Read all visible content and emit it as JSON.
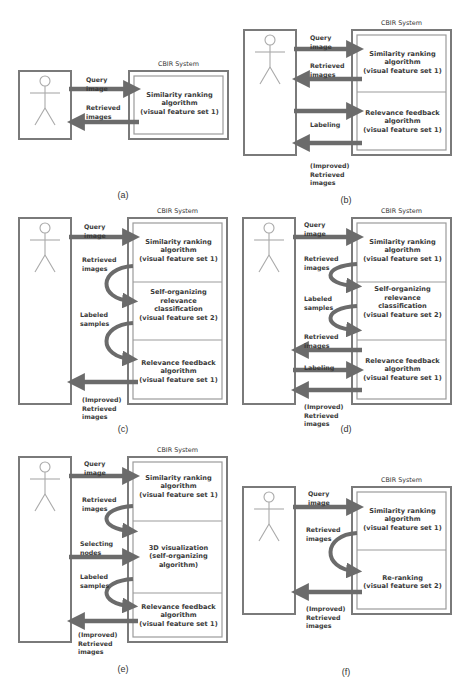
{
  "colors": {
    "outer_border": "#7a7a7a",
    "inner_border": "#9b9b9b",
    "arrow": "#6b6b6b",
    "stick_figure": "#a9a9a9",
    "text": "#3a3a3a"
  },
  "panels": [
    {
      "caption": "(a)",
      "system_title": "CBIR System",
      "modules": [
        [
          "Similarity ranking",
          "algorithm",
          "(visual feature set 1)"
        ]
      ],
      "labels": [
        [
          "Query",
          "image"
        ],
        [
          "Retrieved",
          "images"
        ]
      ]
    },
    {
      "caption": "(b)",
      "system_title": "CBIR System",
      "modules": [
        [
          "Similarity ranking",
          "algorithm",
          "(visual feature set 1)"
        ],
        [
          "Relevance feedback",
          "algorithm",
          "(visual feature set 1)"
        ]
      ],
      "labels": [
        [
          "Query",
          "image"
        ],
        [
          "Retrieved",
          "images"
        ],
        [
          "Labeling"
        ],
        [
          "(Improved)",
          "Retrieved",
          "images"
        ]
      ]
    },
    {
      "caption": "(c)",
      "system_title": "CBIR System",
      "modules": [
        [
          "Similarity ranking",
          "algorithm",
          "(visual feature set 1)"
        ],
        [
          "Self-organizing",
          "relevance",
          "classification",
          "(visual feature set 2)"
        ],
        [
          "Relevance feedback",
          "algorithm",
          "(visual feature set 1)"
        ]
      ],
      "labels": [
        [
          "Query",
          "image"
        ],
        [
          "Retrieved",
          "images"
        ],
        [
          "Labeled",
          "samples"
        ],
        [
          "(Improved)",
          "Retrieved",
          "images"
        ]
      ]
    },
    {
      "caption": "(d)",
      "system_title": "CBIR System",
      "modules": [
        [
          "Similarity ranking",
          "algorithm",
          "(visual feature set 1)"
        ],
        [
          "Self-organizing",
          "relevance",
          "classification",
          "(visual feature set 2)"
        ],
        [
          "Relevance feedback",
          "algorithm",
          "(visual feature set 1)"
        ]
      ],
      "labels": [
        [
          "Query",
          "image"
        ],
        [
          "Retrieved",
          "images"
        ],
        [
          "Labeled",
          "samples"
        ],
        [
          "Retrieved",
          "images"
        ],
        [
          "Labeling"
        ],
        [
          "(Improved)",
          "Retrieved",
          "images"
        ]
      ]
    },
    {
      "caption": "(e)",
      "system_title": "CBIR System",
      "modules": [
        [
          "Similarity ranking",
          "algorithm",
          "(visual feature set 1)"
        ],
        [
          "3D visualization",
          "(self-organizing",
          "algorithm)"
        ],
        [
          "Relevance feedback",
          "algorithm",
          "(visual feature set 1)"
        ]
      ],
      "labels": [
        [
          "Query",
          "image"
        ],
        [
          "Retrieved",
          "images"
        ],
        [
          "Selecting",
          "nodes"
        ],
        [
          "Labeled",
          "samples"
        ],
        [
          "(Improved)",
          "Retrieved",
          "images"
        ]
      ]
    },
    {
      "caption": "(f)",
      "system_title": "CBIR System",
      "modules": [
        [
          "Similarity ranking",
          "algorithm",
          "(visual feature set 1)"
        ],
        [
          "Re-ranking",
          "(visual feature set 2)"
        ]
      ],
      "labels": [
        [
          "Query",
          "image"
        ],
        [
          "Retrieved",
          "images"
        ],
        [
          "(Improved)",
          "Retrieved",
          "images"
        ]
      ]
    }
  ]
}
